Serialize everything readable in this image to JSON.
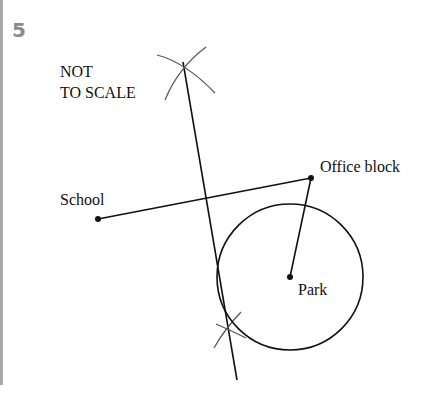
{
  "question_number": "5",
  "note_line1": "NOT",
  "note_line2": "TO SCALE",
  "points": {
    "school": {
      "label": "School",
      "x": 98,
      "y": 219
    },
    "office": {
      "label": "Office block",
      "x": 311,
      "y": 178
    },
    "park": {
      "label": "Park",
      "x": 290,
      "y": 277
    }
  },
  "circle": {
    "cx": 290,
    "cy": 277,
    "r": 73
  },
  "colors": {
    "ink": "#111111",
    "arc": "#555555",
    "bar": "#a8a8a8",
    "number": "#8a8a8a"
  }
}
